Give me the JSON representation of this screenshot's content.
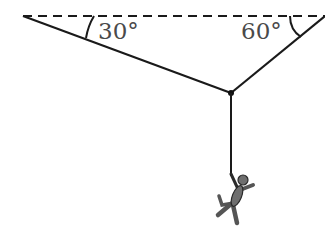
{
  "diagram": {
    "type": "force-diagram",
    "ceiling": {
      "style": "dashed",
      "color": "#000000"
    },
    "angles": {
      "left": {
        "label": "30°",
        "value": 30
      },
      "right": {
        "label": "60°",
        "value": 60
      }
    },
    "colors": {
      "line": "#1a1a1a",
      "label": "#4a4a4a",
      "figure_fill": "#6e6e6e",
      "figure_stroke": "#2a2a2a"
    }
  }
}
